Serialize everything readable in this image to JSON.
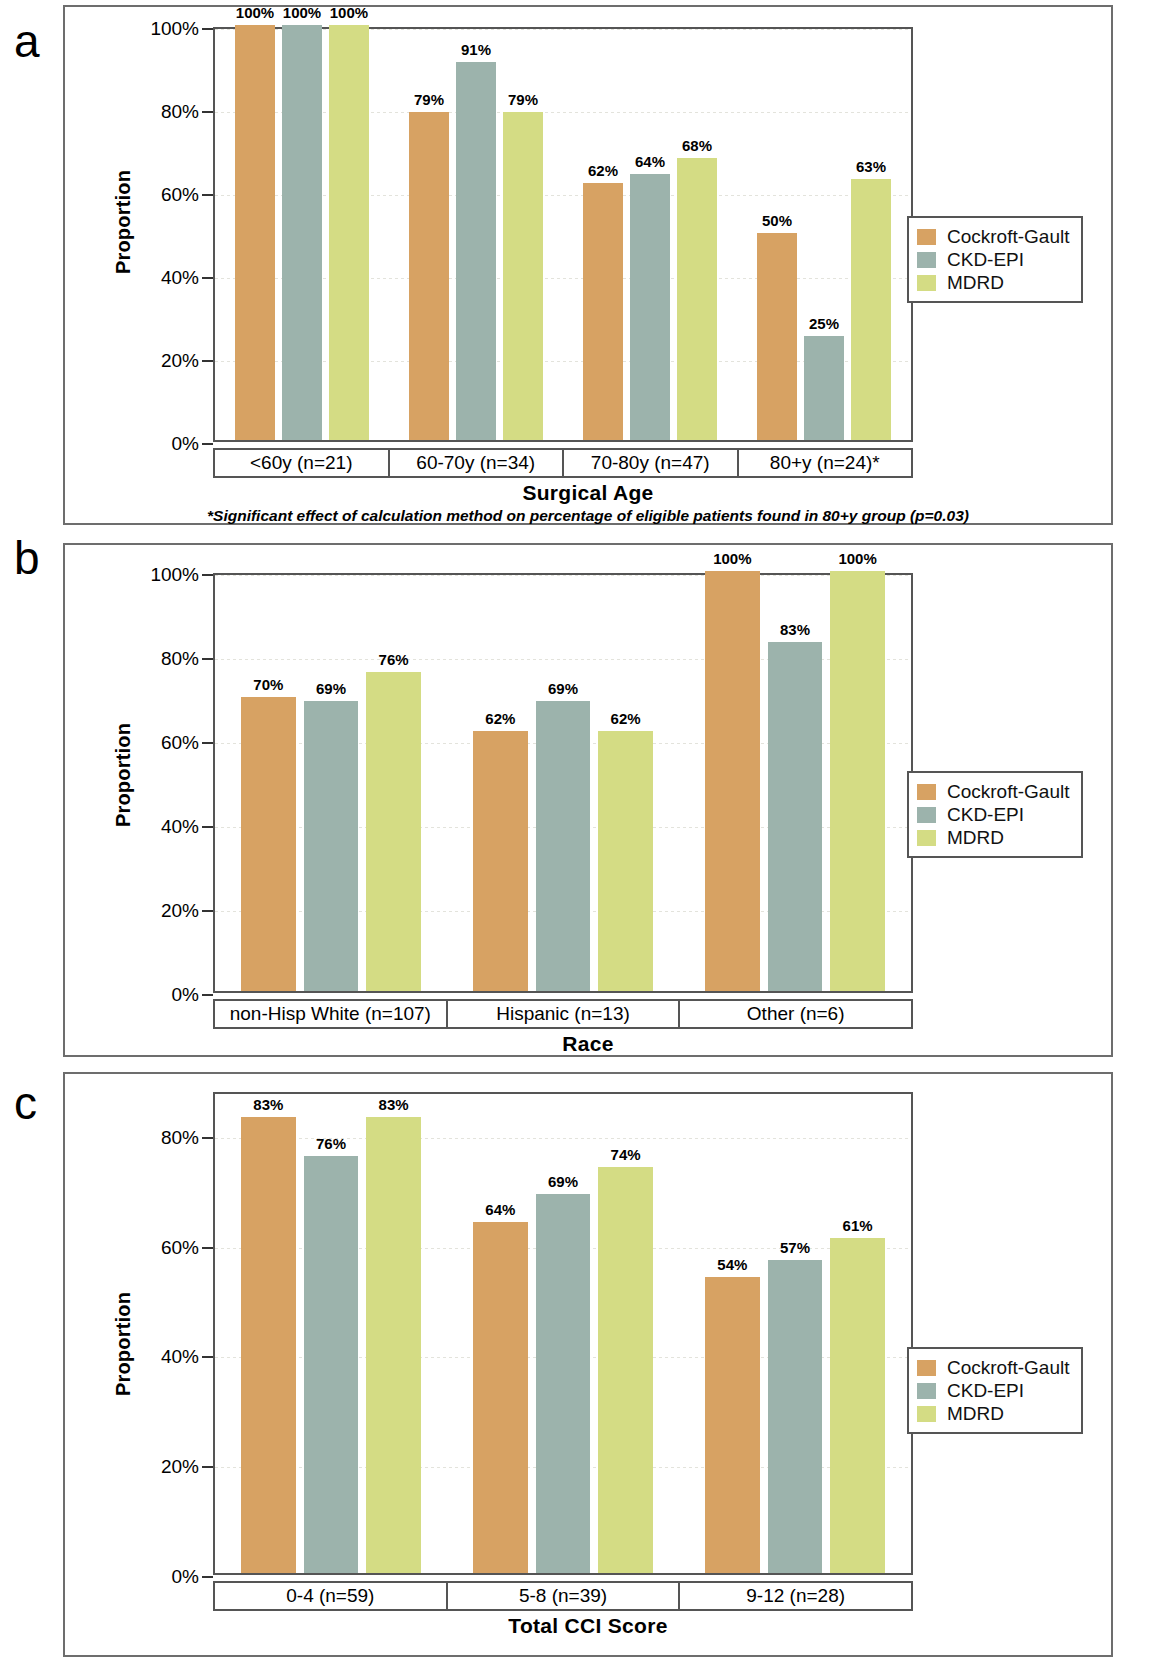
{
  "figure": {
    "series_names": [
      "Cockroft-Gault",
      "CKD-EPI",
      "MDRD"
    ],
    "colors": {
      "cockroft_gault": "#d7a263",
      "ckd_epi": "#9cb3ac",
      "mdrd": "#d4dc84"
    },
    "y_axis_label": "Proportion"
  },
  "panels": [
    {
      "letter": "a",
      "xlabel": "Surgical Age",
      "footnote": "*Significant effect of calculation method on percentage of eligible patients found in 80+y group (p=0.03)",
      "yticks": [
        "0%",
        "20%",
        "40%",
        "60%",
        "80%",
        "100%"
      ],
      "categories": [
        "<60y (n=21)",
        "60-70y (n=34)",
        "70-80y (n=47)",
        "80+y (n=24)*"
      ],
      "bar_labels": [
        [
          "100%",
          "100%",
          "100%"
        ],
        [
          "79%",
          "91%",
          "79%"
        ],
        [
          "62%",
          "64%",
          "68%"
        ],
        [
          "50%",
          "25%",
          "63%"
        ]
      ],
      "legend": [
        "Cockroft-Gault",
        "CKD-EPI",
        "MDRD"
      ]
    },
    {
      "letter": "b",
      "xlabel": "Race",
      "footnote": "",
      "yticks": [
        "0%",
        "20%",
        "40%",
        "60%",
        "80%",
        "100%"
      ],
      "categories": [
        "non-Hisp White (n=107)",
        "Hispanic (n=13)",
        "Other (n=6)"
      ],
      "bar_labels": [
        [
          "70%",
          "69%",
          "76%"
        ],
        [
          "62%",
          "69%",
          "62%"
        ],
        [
          "100%",
          "83%",
          "100%"
        ]
      ],
      "legend": [
        "Cockroft-Gault",
        "CKD-EPI",
        "MDRD"
      ]
    },
    {
      "letter": "c",
      "xlabel": "Total CCI Score",
      "footnote": "",
      "yticks": [
        "0%",
        "20%",
        "40%",
        "60%",
        "80%"
      ],
      "categories": [
        "0-4 (n=59)",
        "5-8 (n=39)",
        "9-12 (n=28)"
      ],
      "bar_labels": [
        [
          "83%",
          "76%",
          "83%"
        ],
        [
          "64%",
          "69%",
          "74%"
        ],
        [
          "54%",
          "57%",
          "61%"
        ]
      ],
      "legend": [
        "Cockroft-Gault",
        "CKD-EPI",
        "MDRD"
      ]
    }
  ],
  "chart_data": [
    {
      "type": "bar",
      "panel": "a",
      "title": "",
      "xlabel": "Surgical Age",
      "ylabel": "Proportion",
      "categories": [
        "<60y (n=21)",
        "60-70y (n=34)",
        "70-80y (n=47)",
        "80+y (n=24)*"
      ],
      "series": [
        {
          "name": "Cockroft-Gault",
          "values": [
            100,
            79,
            62,
            50
          ]
        },
        {
          "name": "CKD-EPI",
          "values": [
            100,
            91,
            64,
            25
          ]
        },
        {
          "name": "MDRD",
          "values": [
            100,
            79,
            68,
            63
          ]
        }
      ],
      "ylim": [
        0,
        100
      ],
      "ytick_values": [
        0,
        20,
        40,
        60,
        80,
        100
      ],
      "ytick_labels": [
        "0%",
        "20%",
        "40%",
        "60%",
        "80%",
        "100%"
      ],
      "grid": true,
      "legend_position": "right",
      "annotation": "*Significant effect of calculation method on percentage of eligible patients found in 80+y group (p=0.03)"
    },
    {
      "type": "bar",
      "panel": "b",
      "title": "",
      "xlabel": "Race",
      "ylabel": "Proportion",
      "categories": [
        "non-Hisp White (n=107)",
        "Hispanic (n=13)",
        "Other (n=6)"
      ],
      "series": [
        {
          "name": "Cockroft-Gault",
          "values": [
            70,
            62,
            100
          ]
        },
        {
          "name": "CKD-EPI",
          "values": [
            69,
            69,
            83
          ]
        },
        {
          "name": "MDRD",
          "values": [
            76,
            62,
            100
          ]
        }
      ],
      "ylim": [
        0,
        100
      ],
      "ytick_values": [
        0,
        20,
        40,
        60,
        80,
        100
      ],
      "ytick_labels": [
        "0%",
        "20%",
        "40%",
        "60%",
        "80%",
        "100%"
      ],
      "grid": true,
      "legend_position": "right",
      "annotation": ""
    },
    {
      "type": "bar",
      "panel": "c",
      "title": "",
      "xlabel": "Total CCI Score",
      "ylabel": "Proportion",
      "categories": [
        "0-4 (n=59)",
        "5-8 (n=39)",
        "9-12 (n=28)"
      ],
      "series": [
        {
          "name": "Cockroft-Gault",
          "values": [
            83,
            64,
            54
          ]
        },
        {
          "name": "CKD-EPI",
          "values": [
            76,
            69,
            57
          ]
        },
        {
          "name": "MDRD",
          "values": [
            83,
            74,
            61
          ]
        }
      ],
      "ylim": [
        0,
        88
      ],
      "ytick_values": [
        0,
        20,
        40,
        60,
        80
      ],
      "ytick_labels": [
        "0%",
        "20%",
        "40%",
        "60%",
        "80%"
      ],
      "grid": true,
      "legend_position": "right",
      "annotation": ""
    }
  ]
}
